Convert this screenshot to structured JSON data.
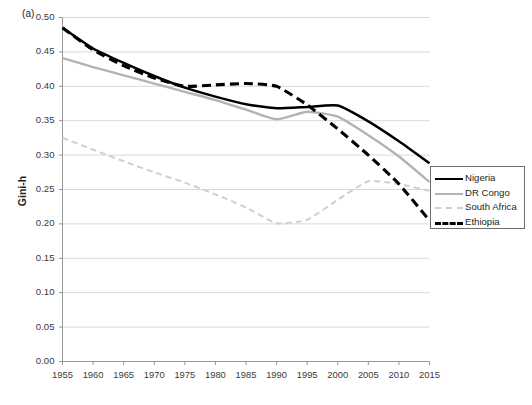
{
  "figure": {
    "panel_label": "(a)",
    "ylabel": "Gini-h"
  },
  "legend": {
    "items": [
      {
        "label": "Nigeria",
        "color": "#000000",
        "style": "solid",
        "width": 2.6
      },
      {
        "label": "DR Congo",
        "color": "#b3b3b3",
        "style": "solid",
        "width": 2.4
      },
      {
        "label": "South Africa",
        "color": "#cfcfcf",
        "style": "dashed",
        "width": 2.0
      },
      {
        "label": "Ethiopia",
        "color": "#000000",
        "style": "dashed",
        "width": 3.0
      }
    ]
  },
  "chart_data": {
    "type": "line",
    "title": "",
    "xlabel": "",
    "ylabel": "Gini-h",
    "xlim": [
      1955,
      2015
    ],
    "ylim": [
      0.0,
      0.5
    ],
    "ytick_step": 0.05,
    "grid": true,
    "legend_position": "right-middle",
    "x": [
      1955,
      1960,
      1965,
      1970,
      1975,
      1980,
      1985,
      1990,
      1995,
      2000,
      2005,
      2010,
      2015
    ],
    "xtick_labels": [
      "1955",
      "1960",
      "1965",
      "1970",
      "1975",
      "1980",
      "1985",
      "1990",
      "1995",
      "2000",
      "2005",
      "2010",
      "2015"
    ],
    "ytick_labels": [
      "0.00",
      "0.05",
      "0.10",
      "0.15",
      "0.20",
      "0.25",
      "0.30",
      "0.35",
      "0.40",
      "0.45",
      "0.50"
    ],
    "series": [
      {
        "name": "Nigeria",
        "color": "#000000",
        "style": "solid",
        "values": [
          0.485,
          0.455,
          0.434,
          0.415,
          0.398,
          0.385,
          0.374,
          0.368,
          0.37,
          0.372,
          0.349,
          0.32,
          0.288
        ]
      },
      {
        "name": "DR Congo",
        "color": "#b3b3b3",
        "style": "solid",
        "values": [
          0.441,
          0.428,
          0.416,
          0.404,
          0.392,
          0.38,
          0.366,
          0.352,
          0.363,
          0.356,
          0.329,
          0.298,
          0.261
        ]
      },
      {
        "name": "South Africa",
        "color": "#cfcfcf",
        "style": "dashed",
        "values": [
          0.325,
          0.308,
          0.291,
          0.275,
          0.26,
          0.243,
          0.224,
          0.201,
          0.206,
          0.235,
          0.262,
          0.258,
          0.248
        ]
      },
      {
        "name": "Ethiopia",
        "color": "#000000",
        "style": "dashed",
        "values": [
          0.485,
          0.453,
          0.43,
          0.412,
          0.4,
          0.402,
          0.404,
          0.4,
          0.373,
          0.338,
          0.3,
          0.258,
          0.205
        ]
      }
    ]
  }
}
